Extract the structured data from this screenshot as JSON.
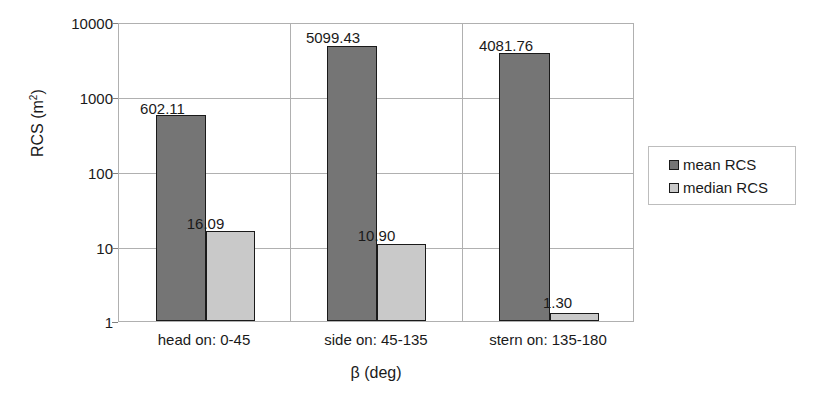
{
  "chart_data": {
    "type": "bar",
    "title": "",
    "xlabel": "β (deg)",
    "ylabel": "RCS (m²)",
    "ylabel_base": "RCS (m",
    "ylabel_sup": "2",
    "ylabel_close": ")",
    "yscale": "log",
    "ylim": [
      1,
      10000
    ],
    "ytick_labels": [
      "10000",
      "1000",
      "100",
      "10",
      "1"
    ],
    "ytick_values": [
      10000,
      1000,
      100,
      10,
      1
    ],
    "grid": true,
    "legend_position": "right",
    "categories": [
      "head on:  0-45",
      "side on: 45-135",
      "stern on: 135-180"
    ],
    "series": [
      {
        "name": "mean RCS",
        "color": "#757575",
        "values": [
          602.11,
          5099.43,
          4081.76
        ],
        "labels": [
          "602.11",
          "5099.43",
          "4081.76"
        ]
      },
      {
        "name": "median RCS",
        "color": "#c9c9c9",
        "values": [
          16.09,
          10.9,
          1.3
        ],
        "labels": [
          "16.09",
          "10.90",
          "1.30"
        ]
      }
    ]
  },
  "legend": {
    "items": [
      {
        "label": "mean RCS"
      },
      {
        "label": "median RCS"
      }
    ]
  },
  "axes": {
    "y_ticks": [
      {
        "label": "10000"
      },
      {
        "label": "1000"
      },
      {
        "label": "100"
      },
      {
        "label": "10"
      },
      {
        "label": "1"
      }
    ],
    "x_categories": [
      {
        "label": "head on:  0-45"
      },
      {
        "label": "side on: 45-135"
      },
      {
        "label": "stern on: 135-180"
      }
    ]
  },
  "labels": {
    "group1_mean": "602.11",
    "group1_median": "16.09",
    "group2_mean": "5099.43",
    "group2_median": "10.90",
    "group3_mean": "4081.76",
    "group3_median": "1.30"
  }
}
